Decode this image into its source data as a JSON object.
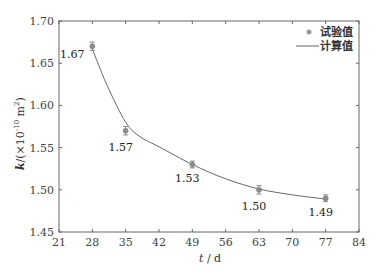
{
  "chart_data": {
    "type": "scatter",
    "title": "",
    "xlabel": "t / d",
    "ylabel": "k /(×10^-10 m^2)",
    "xlim": [
      21,
      84
    ],
    "ylim": [
      1.45,
      1.7
    ],
    "xticks": [
      21,
      28,
      35,
      42,
      49,
      56,
      63,
      70,
      77,
      84
    ],
    "yticks": [
      1.45,
      1.5,
      1.55,
      1.6,
      1.65,
      1.7
    ],
    "grid": false,
    "legend_position": "upper right",
    "series": [
      {
        "name": "试验值",
        "kind": "scatter_with_errorbars",
        "color": "#888888",
        "x": [
          28,
          35,
          49,
          63,
          77
        ],
        "y": [
          1.67,
          1.57,
          1.53,
          1.5,
          1.49
        ],
        "error": [
          0.005,
          0.005,
          0.004,
          0.005,
          0.004
        ],
        "labels": [
          "1.67",
          "1.57",
          "1.53",
          "1.50",
          "1.49"
        ]
      },
      {
        "name": "计算值",
        "kind": "line",
        "color": "#555555",
        "x": [
          28,
          31,
          35,
          38,
          42,
          49,
          56,
          63,
          70,
          77
        ],
        "y": [
          1.667,
          1.625,
          1.58,
          1.563,
          1.551,
          1.53,
          1.513,
          1.501,
          1.494,
          1.489
        ]
      }
    ]
  },
  "axes": {
    "ylabel_k": "k",
    "ylabel_rest": "/(×10",
    "ylabel_exp": "-10",
    "ylabel_unit": " m",
    "ylabel_unit_exp": "2",
    "ylabel_close": ")",
    "xlabel_t": "t",
    "xlabel_rest": " / d"
  },
  "legend": {
    "items": [
      {
        "label": "试验值",
        "marker": "dot"
      },
      {
        "label": "计算值",
        "marker": "line"
      }
    ]
  }
}
